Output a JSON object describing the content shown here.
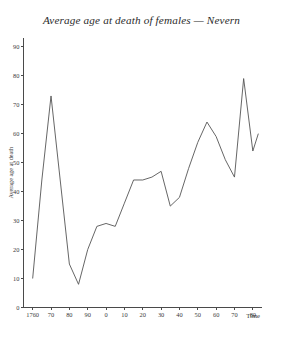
{
  "chart_data": {
    "type": "line",
    "title": "Average age at death of females — Nevern",
    "xlabel": "Time",
    "ylabel": "Average age at death",
    "xlim": [
      1755,
      1885
    ],
    "ylim": [
      0,
      93
    ],
    "grid": false,
    "legend": null,
    "x_tick_labels": [
      "1760",
      "70",
      "80",
      "90",
      "0",
      "10",
      "20",
      "30",
      "40",
      "50",
      "60",
      "70",
      "80"
    ],
    "x_tick_values": [
      1760,
      1770,
      1780,
      1790,
      1800,
      1810,
      1820,
      1830,
      1840,
      1850,
      1860,
      1870,
      1880
    ],
    "y_tick_labels": [
      "0",
      "10",
      "20",
      "30",
      "40",
      "50",
      "60",
      "70",
      "80",
      "90"
    ],
    "y_tick_values": [
      0,
      10,
      20,
      30,
      40,
      50,
      60,
      70,
      80,
      90
    ],
    "x": [
      1760,
      1765,
      1770,
      1775,
      1780,
      1785,
      1790,
      1795,
      1800,
      1805,
      1810,
      1815,
      1820,
      1825,
      1830,
      1835,
      1840,
      1845,
      1850,
      1855,
      1860,
      1865,
      1870,
      1875,
      1880
    ],
    "values": [
      10,
      44,
      73,
      44,
      15,
      8,
      20,
      28,
      29,
      28,
      36,
      44,
      44,
      45,
      47,
      35,
      38,
      48,
      57,
      64,
      59,
      51,
      45,
      79,
      54
    ],
    "series": [
      {
        "name": "Average age at death of females, Nevern",
        "values": [
          10,
          44,
          73,
          44,
          15,
          8,
          20,
          28,
          29,
          28,
          36,
          44,
          44,
          45,
          47,
          35,
          38,
          48,
          57,
          64,
          59,
          51,
          45,
          79,
          54
        ]
      }
    ],
    "final_point": {
      "x": 1883,
      "y": 60
    },
    "colors": {
      "line": "#555555",
      "axis": "#4a4a4a",
      "text": "#3a3a3a",
      "background": "#ffffff"
    }
  }
}
